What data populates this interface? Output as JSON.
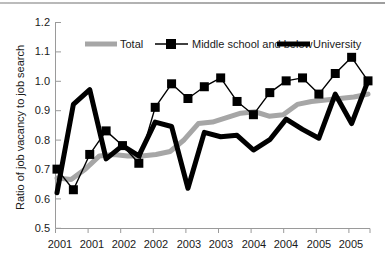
{
  "chart_data": {
    "type": "line",
    "title": "",
    "xlabel": "",
    "ylabel": "Ratio of job vacancy to job search",
    "ylim": [
      0.5,
      1.2
    ],
    "ytick_labels": [
      "1.2",
      "1.1",
      "1.0",
      "0.9",
      "0.8",
      "0.7",
      "0.6",
      "0.5"
    ],
    "ytick_values": [
      1.2,
      1.1,
      1.0,
      0.9,
      0.8,
      0.7,
      0.6,
      0.5
    ],
    "xtick_labels": [
      "2001",
      "2001",
      "2002",
      "2002",
      "2003",
      "2003",
      "2004",
      "2004",
      "2005",
      "2005"
    ],
    "grid": false,
    "legend_position": "top-inside",
    "n_points": 20,
    "series": [
      {
        "name": "Total",
        "color": "#a6a6a6",
        "style": "thick-line",
        "marker": "none",
        "values": [
          0.67,
          0.665,
          0.7,
          0.745,
          0.75,
          0.745,
          0.745,
          0.75,
          0.76,
          0.8,
          0.855,
          0.86,
          0.875,
          0.89,
          0.895,
          0.88,
          0.885,
          0.92,
          0.93,
          0.935,
          0.94,
          0.945,
          0.955
        ]
      },
      {
        "name": "Middle school and below",
        "color": "#000000",
        "style": "thin-line-with-square-markers",
        "marker": "square",
        "values": [
          0.7,
          0.63,
          0.75,
          0.83,
          0.78,
          0.72,
          0.91,
          0.99,
          0.94,
          0.98,
          1.01,
          0.93,
          0.885,
          0.96,
          1.0,
          1.01,
          0.955,
          1.025,
          1.08,
          1.0
        ]
      },
      {
        "name": "University",
        "color": "#000000",
        "style": "thick-line",
        "marker": "none",
        "values": [
          0.62,
          0.92,
          0.97,
          0.735,
          0.78,
          0.745,
          0.86,
          0.845,
          0.635,
          0.825,
          0.81,
          0.815,
          0.765,
          0.8,
          0.87,
          0.835,
          0.805,
          0.955,
          0.855,
          1.0
        ]
      }
    ]
  },
  "legend": {
    "items": [
      {
        "label": "Total",
        "swatch": "thick-gray-line"
      },
      {
        "label": "Middle school and below",
        "swatch": "thin-line-square-marker"
      },
      {
        "label": "University",
        "swatch": "thick-black-line"
      }
    ]
  },
  "colors": {
    "total": "#a6a6a6",
    "middle_school": "#000000",
    "university": "#000000",
    "axis": "#9a9a9a",
    "text": "#1a1a1a"
  }
}
